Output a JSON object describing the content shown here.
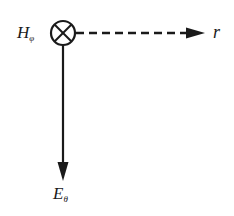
{
  "diagram": {
    "labels": {
      "h_field": {
        "main": "H",
        "sub": "φ"
      },
      "radial": {
        "main": "r"
      },
      "e_field": {
        "main": "E",
        "sub": "θ"
      }
    },
    "elements": {
      "source_symbol": "circle-with-cross (vector into page)",
      "radial_arrow": "dashed horizontal arrow to the right",
      "e_arrow": "solid vertical arrow downward"
    },
    "colors": {
      "ink": "#1a1a1a",
      "background": "#ffffff"
    }
  }
}
